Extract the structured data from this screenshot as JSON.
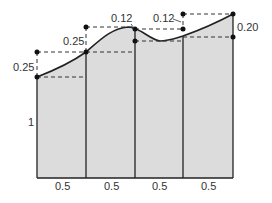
{
  "diagram": {
    "type": "trapezoid-rectangle-decomposition",
    "widths": [
      "0.5",
      "0.5",
      "0.5",
      "0.5"
    ],
    "base_height_label": "1",
    "increment_labels": {
      "left_outer": "0.25",
      "second_line": "0.25",
      "third_line_top": "0.12",
      "fourth_line_top": "0.12",
      "right_edge": "0.20"
    },
    "colors": {
      "fill": "#dcdcdc",
      "stroke": "#222222",
      "dashed": "#333333"
    }
  }
}
